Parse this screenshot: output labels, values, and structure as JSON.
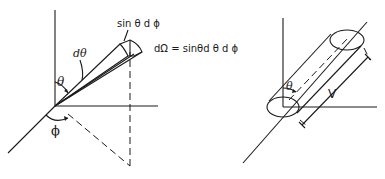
{
  "figure": {
    "left_panel": {
      "title": "Solid angle element in spherical coordinates",
      "labels": {
        "theta": "θ",
        "dtheta": "dθ",
        "phi": "ϕ",
        "arc_label": "sin θ d ϕ",
        "formula": "dΩ = sinθd θ d ϕ"
      }
    },
    "right_panel": {
      "title": "Cylindrical volume along direction θ",
      "labels": {
        "theta": "θ",
        "length": "V"
      }
    },
    "colors": {
      "ink": "#1a1a1a",
      "background": "#ffffff"
    }
  }
}
